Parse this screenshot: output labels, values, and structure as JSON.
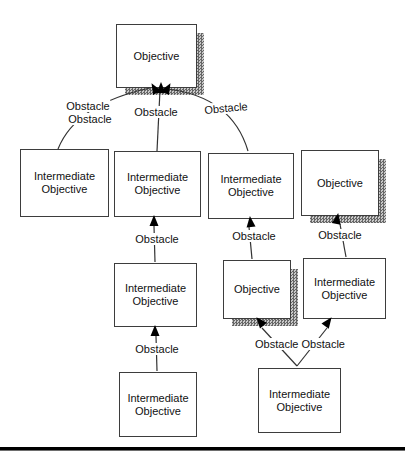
{
  "diagram": {
    "canvas": {
      "width": 405,
      "height": 461
    },
    "shadow_offset": {
      "x": 9,
      "y": 9
    },
    "colors": {
      "line": "#333333",
      "box_border": "#3d3d3d",
      "shadow_dark": "#666666",
      "shadow_light": "#c9c9c9",
      "text": "#111111",
      "rule": "#000000"
    },
    "boxes": [
      {
        "id": "top-objective",
        "label": "Objective",
        "x": 116,
        "y": 24,
        "w": 79,
        "h": 62,
        "shadow": true
      },
      {
        "id": "io-left",
        "label": "Intermediate Objective",
        "x": 20,
        "y": 149,
        "w": 87,
        "h": 66,
        "shadow": false
      },
      {
        "id": "io-mid-upper",
        "label": "Intermediate Objective",
        "x": 114,
        "y": 151,
        "w": 85,
        "h": 64,
        "shadow": false
      },
      {
        "id": "io-right-upper",
        "label": "Intermediate Objective",
        "x": 208,
        "y": 153,
        "w": 84,
        "h": 64,
        "shadow": false
      },
      {
        "id": "objective-far-right",
        "label": "Objective",
        "x": 301,
        "y": 150,
        "w": 76,
        "h": 64,
        "shadow": true
      },
      {
        "id": "io-mid-middle",
        "label": "Intermediate Objective",
        "x": 114,
        "y": 263,
        "w": 81,
        "h": 62,
        "shadow": false
      },
      {
        "id": "objective-mid-right",
        "label": "Objective",
        "x": 223,
        "y": 260,
        "w": 66,
        "h": 57,
        "shadow": true
      },
      {
        "id": "io-right-middle",
        "label": "Intermediate Objective",
        "x": 303,
        "y": 258,
        "w": 81,
        "h": 59,
        "shadow": false
      },
      {
        "id": "io-mid-bottom",
        "label": "Intermediate Objective",
        "x": 119,
        "y": 372,
        "w": 76,
        "h": 63,
        "shadow": false
      },
      {
        "id": "io-bottom-right",
        "label": "Intermediate Objective",
        "x": 258,
        "y": 368,
        "w": 81,
        "h": 63,
        "shadow": false
      }
    ],
    "labels": [
      {
        "id": "obstacle-top-left-1",
        "text": "Obstacle",
        "cx": 88,
        "cy": 106,
        "rot": 0
      },
      {
        "id": "obstacle-top-left-2",
        "text": "Obstacle",
        "cx": 90,
        "cy": 119,
        "rot": 0
      },
      {
        "id": "obstacle-top-middle",
        "text": "Obstacle",
        "cx": 156,
        "cy": 112,
        "rot": 0
      },
      {
        "id": "obstacle-top-right",
        "text": "Obstacle",
        "cx": 226,
        "cy": 108,
        "rot": -5
      },
      {
        "id": "obstacle-mid-center",
        "text": "Obstacle",
        "cx": 157,
        "cy": 239,
        "rot": 0
      },
      {
        "id": "obstacle-mid-right-1",
        "text": "Obstacle",
        "cx": 254,
        "cy": 236,
        "rot": 0
      },
      {
        "id": "obstacle-mid-right-2",
        "text": "Obstacle",
        "cx": 340,
        "cy": 235,
        "rot": 0
      },
      {
        "id": "obstacle-low-center",
        "text": "Obstacle",
        "cx": 157,
        "cy": 349,
        "rot": 0
      },
      {
        "id": "obstacle-bottom-pair",
        "text": "Obstacle Obstacle",
        "cx": 300,
        "cy": 344,
        "rot": 0
      }
    ],
    "connectors": [
      {
        "id": "c-left-curve",
        "path": "M 58 149 Q 76 104 150 88"
      },
      {
        "id": "c-middle-line",
        "path": "M 157 151 L 160 90"
      },
      {
        "id": "c-right-curve",
        "path": "M 248 151 Q 232 97 168 89"
      },
      {
        "id": "c-mid-col-upper",
        "path": "M 155 262 L 154 226"
      },
      {
        "id": "c-mid-col-lower",
        "path": "M 157 371 L 156 336"
      },
      {
        "id": "c-objmid-to-upper",
        "path": "M 252 259 L 249 227"
      },
      {
        "id": "c-ioright-to-obj",
        "path": "M 346 257 L 340 224"
      },
      {
        "id": "c-bottom-v-left",
        "path": "M 297 366 L 262 328"
      },
      {
        "id": "c-bottom-v-right",
        "path": "M 297 366 L 327 328"
      }
    ],
    "arrowheads": [
      {
        "x": 152,
        "y": 84,
        "angle": -30
      },
      {
        "x": 161,
        "y": 83,
        "angle": 0
      },
      {
        "x": 170,
        "y": 84,
        "angle": 30
      },
      {
        "x": 154,
        "y": 216,
        "angle": 0
      },
      {
        "x": 155,
        "y": 326,
        "angle": 0
      },
      {
        "x": 250,
        "y": 217,
        "angle": -6
      },
      {
        "x": 338,
        "y": 214,
        "angle": 10
      },
      {
        "x": 257,
        "y": 318,
        "angle": -40
      },
      {
        "x": 331,
        "y": 318,
        "angle": 36
      }
    ]
  }
}
